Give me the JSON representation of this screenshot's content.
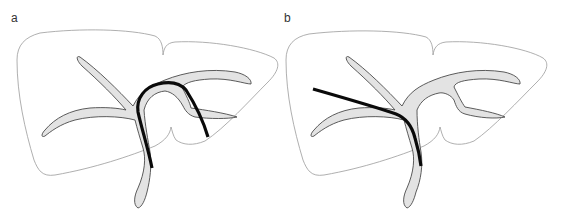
{
  "figure": {
    "panels": [
      {
        "id": "a",
        "label": "a",
        "description": "Liver outline with biliary tree; guidewire passes from common duct, loops over the hilum into the right lobe branch"
      },
      {
        "id": "b",
        "label": "b",
        "description": "Liver outline with biliary tree; guidewire passes from common duct into the left lobe, extending beyond the duct"
      }
    ],
    "colors": {
      "liver_outline": "#9a9a9a",
      "duct_fill": "#e3e3e3",
      "duct_stroke": "#4a4a4a",
      "wire": "#0a0a0a",
      "label": "#333333"
    }
  }
}
